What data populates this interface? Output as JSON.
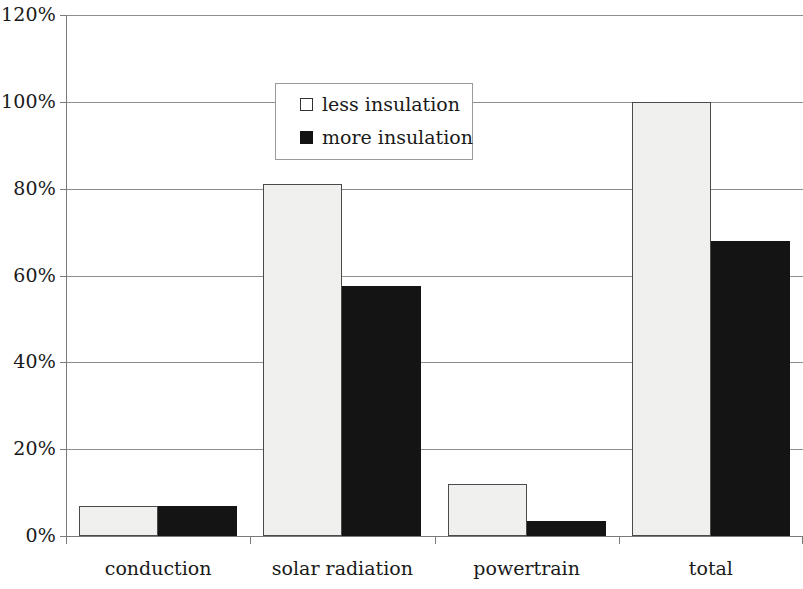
{
  "chart_data": {
    "type": "bar",
    "title": "",
    "subtitle": "",
    "xlabel": "",
    "ylabel": "",
    "categories": [
      "conduction",
      "solar radiation",
      "powertrain",
      "total"
    ],
    "series": [
      {
        "name": "less insulation",
        "color": "#f0f0ee",
        "values": [
          7,
          81,
          12,
          100
        ]
      },
      {
        "name": "more insulation",
        "color": "#141414",
        "values": [
          7,
          57.5,
          3.5,
          68
        ]
      }
    ],
    "ylim": [
      0,
      120
    ],
    "ytick_values": [
      0,
      20,
      40,
      60,
      80,
      100,
      120
    ],
    "ytick_labels": [
      "0%",
      "20%",
      "40%",
      "60%",
      "80%",
      "100%",
      "120%"
    ],
    "grid": "horizontal",
    "legend_position": "upper-center",
    "value_format": "percent"
  },
  "legend": {
    "items": [
      {
        "label": "less insulation",
        "swatch": "light"
      },
      {
        "label": "more insulation",
        "swatch": "dark"
      }
    ]
  }
}
